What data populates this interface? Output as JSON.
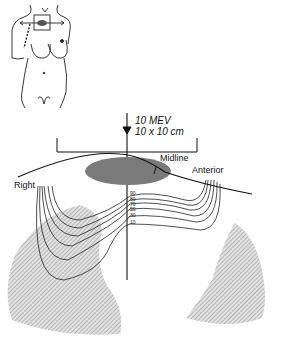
{
  "beam": {
    "energy": "10 MEV",
    "field_size": "10 x 10 cm"
  },
  "labels": {
    "midline": "Midline",
    "anterior": "Anterior",
    "right": "Right"
  },
  "isodose_levels": [
    "90",
    "80",
    "70",
    "50",
    "30",
    "10"
  ],
  "colors": {
    "line": "#111111",
    "tumor": "#7a7a7a",
    "lung": "#c8c8c8"
  }
}
